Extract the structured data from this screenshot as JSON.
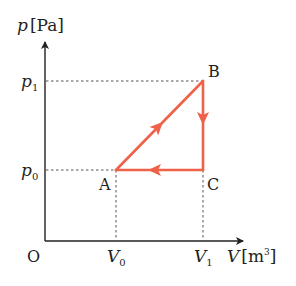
{
  "diagram": {
    "type": "p-V diagram",
    "axes": {
      "y_label_var": "p",
      "y_label_unit": "[Pa]",
      "x_label_var": "V",
      "x_label_unit_base": "[m",
      "x_label_unit_sup": "3",
      "x_label_unit_close": "]",
      "origin_label": "O"
    },
    "ticks": {
      "p1": {
        "var": "p",
        "sub": "1"
      },
      "p0": {
        "var": "p",
        "sub": "0"
      },
      "V0": {
        "var": "V",
        "sub": "0"
      },
      "V1": {
        "var": "V",
        "sub": "1"
      }
    },
    "points": {
      "A": {
        "label": "A",
        "V": "V0",
        "p": "p0"
      },
      "B": {
        "label": "B",
        "V": "V1",
        "p": "p1"
      },
      "C": {
        "label": "C",
        "V": "V1",
        "p": "p0"
      }
    },
    "cycle": [
      "A→B",
      "B→C",
      "C→A"
    ],
    "colors": {
      "cycle_line": "#F0614A",
      "axis": "#231f20",
      "dashed_guides": "#555555"
    }
  }
}
